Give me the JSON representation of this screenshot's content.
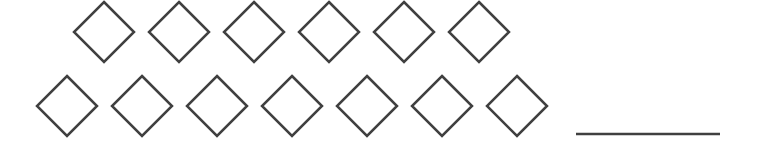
{
  "figure": {
    "stroke_color": "#404040",
    "rows": [
      {
        "count": 6,
        "centers_x": [
          104,
          179,
          254,
          329,
          404,
          479
        ],
        "center_y": 32
      },
      {
        "count": 7,
        "centers_x": [
          67,
          142,
          217,
          292,
          367,
          442,
          517
        ],
        "center_y": 106
      }
    ],
    "diamond_half_size": 30,
    "answer_blank": {
      "x1": 576,
      "x2": 720,
      "y": 134,
      "value": ""
    }
  }
}
